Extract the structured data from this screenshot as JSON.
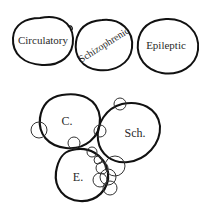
{
  "top_row": {
    "circles": [
      {
        "label": "Circulatory"
      },
      {
        "label": "Schizophrenic"
      },
      {
        "label": "Epileptic"
      }
    ]
  },
  "bottom_cluster": {
    "circles": [
      {
        "label": "C."
      },
      {
        "label": "Sch."
      },
      {
        "label": "E."
      }
    ]
  },
  "colors": {
    "stroke": "#111111",
    "text": "#2a2a2a",
    "background": "#ffffff"
  }
}
